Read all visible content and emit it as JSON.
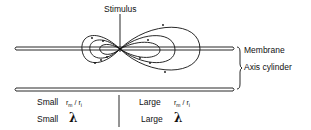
{
  "diagram": {
    "stimulus_label": "Stimulus",
    "membrane_label": "Membrane",
    "axis_cylinder_label": "Axis cylinder",
    "left_panel": {
      "size_word": "Small",
      "ratio_r": "r",
      "ratio_m": "m",
      "ratio_slash": "/",
      "ratio_r2": "r",
      "ratio_i": "i",
      "lambda_word": "Small",
      "lambda_symbol": "λ"
    },
    "right_panel": {
      "size_word": "Large",
      "ratio_r": "r",
      "ratio_m": "m",
      "ratio_slash": "/",
      "ratio_r2": "r",
      "ratio_i": "i",
      "lambda_word": "Large",
      "lambda_symbol": "λ"
    },
    "line_color": "#111111"
  }
}
